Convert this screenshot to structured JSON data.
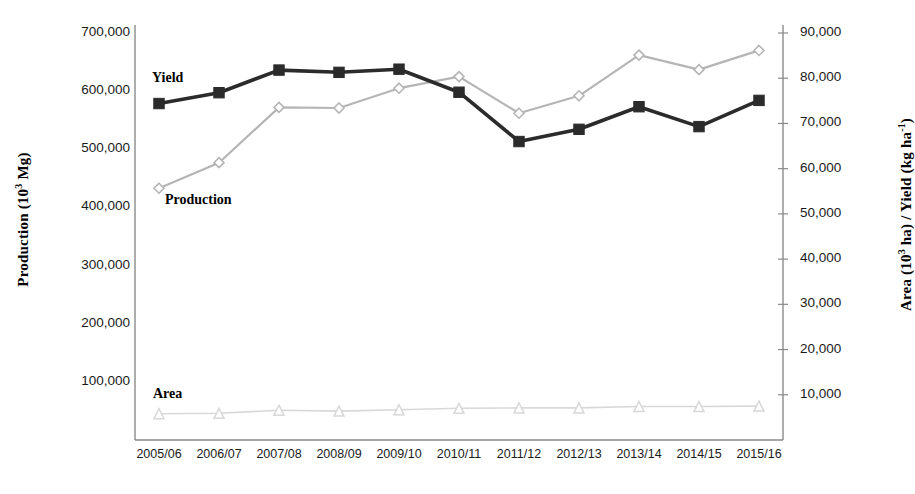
{
  "chart_data": {
    "type": "line",
    "title": "",
    "xlabel": "",
    "ylabel": "Production (10³ Mg)",
    "y2label": "Area (10³ ha) / Yield (kg ha⁻¹)",
    "categories": [
      "2005/06",
      "2006/07",
      "2007/08",
      "2008/09",
      "2009/10",
      "2010/11",
      "2011/12",
      "2012/13",
      "2013/14",
      "2014/15",
      "2015/16"
    ],
    "ylim": [
      0,
      700000
    ],
    "y2lim": [
      0,
      90000
    ],
    "yticks": [
      "100,000",
      "200,000",
      "300,000",
      "400,000",
      "500,000",
      "600,000",
      "700,000"
    ],
    "ytick_values": [
      100000,
      200000,
      300000,
      400000,
      500000,
      600000,
      700000
    ],
    "y2ticks": [
      "10,000",
      "20,000",
      "30,000",
      "40,000",
      "50,000",
      "60,000",
      "70,000",
      "80,000",
      "90,000"
    ],
    "y2tick_values": [
      10000,
      20000,
      30000,
      40000,
      50000,
      60000,
      70000,
      80000,
      90000
    ],
    "grid": false,
    "legend_position": "inline-annotations",
    "series": [
      {
        "name": "Yield",
        "axis": "right",
        "units": "kg ha⁻¹",
        "marker": "square",
        "color": "#2b2b2b",
        "values": [
          74400,
          76800,
          81800,
          81300,
          82000,
          76900,
          66000,
          68700,
          73700,
          69300,
          75100
        ]
      },
      {
        "name": "Production",
        "axis": "left",
        "units": "10³ Mg",
        "marker": "diamond",
        "color": "#b5b5b5",
        "values": [
          433000,
          477000,
          572000,
          571000,
          605000,
          625000,
          562000,
          592000,
          662000,
          637000,
          670000
        ]
      },
      {
        "name": "Area",
        "axis": "right",
        "units": "10³ ha",
        "marker": "triangle",
        "color": "#d8d8d8",
        "values": [
          5800,
          5900,
          6600,
          6400,
          6700,
          7000,
          7100,
          7100,
          7400,
          7400,
          7500
        ]
      }
    ],
    "annotations": [
      {
        "text": "Yield",
        "series": "Yield"
      },
      {
        "text": "Production",
        "series": "Production"
      },
      {
        "text": "Area",
        "series": "Area"
      }
    ],
    "colors": {
      "yield": "#2b2b2b",
      "production": "#b5b5b5",
      "area": "#d8d8d8",
      "axis": "#8a8a8a",
      "text": "#111111",
      "background": "#ffffff"
    }
  }
}
